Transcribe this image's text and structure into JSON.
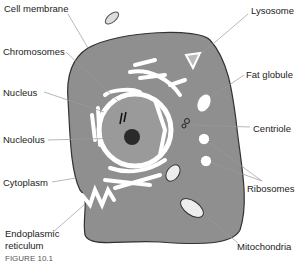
{
  "diagram": {
    "caption": "FIGURE 10.1",
    "labels": {
      "cell_membrane": "Cell membrane",
      "chromosomes": "Chromosomes",
      "nucleus": "Nucleus",
      "nucleolus": "Nucleolus",
      "cytoplasm": "Cytoplasm",
      "er_line1": "Endoplasmic",
      "er_line2": "reticulum",
      "lysosome": "Lysosome",
      "fat_globule": "Fat globule",
      "centriole": "Centriole",
      "ribosomes": "Ribosomes",
      "mitochondria": "Mitochondria"
    },
    "colors": {
      "cytoplasm": "#8f8f8f",
      "outline": "#333333",
      "organelle": "#ffffff",
      "nucleolus": "#2a2a2a",
      "leader_line": "#9a9a9a"
    }
  }
}
